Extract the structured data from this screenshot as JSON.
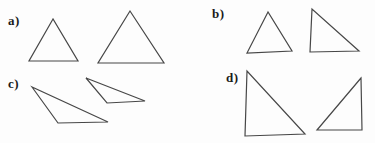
{
  "style": {
    "background": "#fdfdfd",
    "line_color": "#474747",
    "label_color": "#1b1b1b"
  },
  "sections": [
    {
      "label": "a)",
      "triangles": [
        {
          "name": "small isosceles triangle",
          "points": "53,19 29,61 78,61"
        },
        {
          "name": "large isosceles triangle",
          "points": "130,11 98,63 164,63"
        }
      ]
    },
    {
      "label": "b)",
      "triangles": [
        {
          "name": "isosceles triangle",
          "points": "268,12 247,53 292,51"
        },
        {
          "name": "right triangle",
          "points": "312,9 310,52 359,51"
        }
      ]
    },
    {
      "label": "c)",
      "triangles": [
        {
          "name": "large obtuse scalene triangle",
          "points": "32,87 58,123 108,122"
        },
        {
          "name": "small obtuse scalene triangle",
          "points": "86,78 107,103 145,101"
        }
      ]
    },
    {
      "label": "d)",
      "triangles": [
        {
          "name": "large right triangle",
          "points": "247,71 245,136 305,134"
        },
        {
          "name": "small mirrored right triangle",
          "points": "361,78 317,130 362,130"
        }
      ]
    }
  ]
}
